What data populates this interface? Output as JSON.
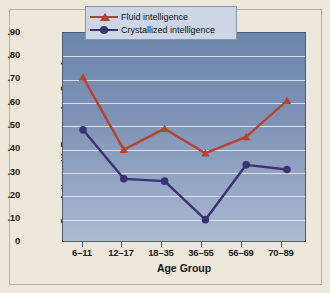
{
  "chart_data": {
    "type": "line",
    "title": "",
    "xlabel": "Age Group",
    "ylabel": "Correlation with Processing Speed",
    "categories": [
      "6–11",
      "12–17",
      "18–35",
      "36–55",
      "56–69",
      "70–89"
    ],
    "ylim": [
      0,
      0.9
    ],
    "ytick_labels": [
      ".90",
      ".80",
      ".70",
      ".60",
      ".50",
      ".40",
      ".30",
      ".20",
      ".10",
      "0"
    ],
    "ytick_values": [
      0.9,
      0.8,
      0.7,
      0.6,
      0.5,
      0.4,
      0.3,
      0.2,
      0.1,
      0
    ],
    "grid": true,
    "legend_position": "top-right",
    "series": [
      {
        "name": "Fluid intelligence",
        "color": "#b8422c",
        "marker": "triangle",
        "values": [
          0.71,
          0.4,
          0.49,
          0.385,
          0.455,
          0.61
        ]
      },
      {
        "name": "Crystallized intelligence",
        "color": "#3b3273",
        "marker": "circle",
        "values": [
          0.485,
          0.275,
          0.265,
          0.1,
          0.335,
          0.315
        ]
      }
    ]
  },
  "colors": {
    "page_background": "#eee8da",
    "plot_background_top": "#6d86ad",
    "plot_background_bottom": "#adbad2",
    "gridline": "#e9edf4",
    "legend_background": "#ccd6e4",
    "axis": "#4a5a74"
  }
}
